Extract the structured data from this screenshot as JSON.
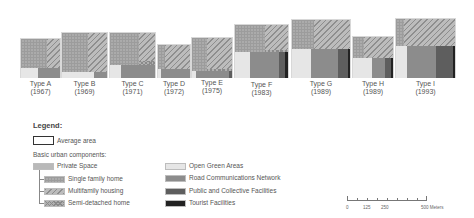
{
  "types": [
    {
      "name": "Type A",
      "year": "(1967)"
    },
    {
      "name": "Type B",
      "year": "(1969)"
    },
    {
      "name": "Type C",
      "year": "(1971)"
    },
    {
      "name": "Type D",
      "year": "(1972)"
    },
    {
      "name": "Type E",
      "year": "(1975)"
    },
    {
      "name": "Type F",
      "year": "(1983)"
    },
    {
      "name": "Type G",
      "year": "(1989)"
    },
    {
      "name": "Type H",
      "year": "(1989)"
    },
    {
      "name": "Type I",
      "year": "(1993)"
    }
  ],
  "legend": {
    "title": "Legend:",
    "average_area": "Average area",
    "components_heading": "Basic urban components:",
    "private_space": "Private Space",
    "single_family": "Single family home",
    "multifamily": "Multifamily housing",
    "semi_detached": "Semi-detached home",
    "open_green": "Open Green Areas",
    "road": "Road Communications Network",
    "public": "Public and Collective Facilities",
    "tourist": "Tourist Facilities"
  },
  "scale_bar": {
    "labels": [
      "0",
      "125",
      "250",
      "500 Meters"
    ]
  },
  "colors": {
    "open_green": "#e6e6e6",
    "road": "#8c8c8c",
    "public": "#5e5e5e",
    "tourist": "#222222",
    "private": "#b9b9b9"
  }
}
